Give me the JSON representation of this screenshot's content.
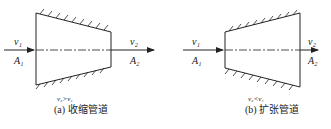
{
  "figure_a": {
    "caption": "(a) 收缩管道",
    "inlet_velocity": "v₁",
    "inlet_area": "A₁",
    "outlet_velocity": "v₂",
    "outlet_area": "A₂",
    "condition": "v₂>v₁"
  },
  "figure_b": {
    "caption": "(b) 扩张管道",
    "inlet_velocity": "v₁",
    "inlet_area": "A₁",
    "outlet_velocity": "v₂",
    "outlet_area": "A₂",
    "condition": "v₂<v₁"
  }
}
